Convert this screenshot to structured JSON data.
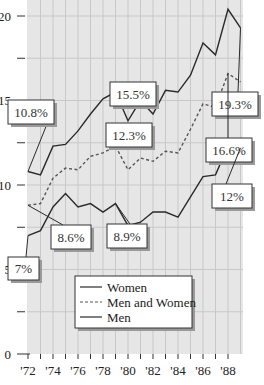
{
  "chart_data": {
    "type": "line",
    "title": "",
    "xlabel": "",
    "ylabel": "",
    "x": [
      1972,
      1973,
      1974,
      1975,
      1976,
      1977,
      1978,
      1979,
      1980,
      1981,
      1982,
      1983,
      1984,
      1985,
      1986,
      1987,
      1988,
      1989
    ],
    "x_tick_labels": [
      "'72",
      "'74",
      "'76",
      "'78",
      "'80",
      "'82",
      "'84",
      "'86",
      "'88"
    ],
    "x_tick_values": [
      1972,
      1974,
      1976,
      1978,
      1980,
      1982,
      1984,
      1986,
      1988
    ],
    "y_tick_labels": [
      "0",
      "5",
      "10",
      "15",
      "20"
    ],
    "y_tick_values": [
      0,
      5,
      10,
      15,
      20
    ],
    "ylim": [
      0,
      21
    ],
    "xlim": [
      1972,
      1989.2
    ],
    "grid": true,
    "legend_position": "lower center",
    "series": [
      {
        "name": "Women",
        "style": "solid",
        "values": [
          10.8,
          10.6,
          12.3,
          12.4,
          13.2,
          14.2,
          15.1,
          15.5,
          13.8,
          15.0,
          14.2,
          15.6,
          15.5,
          16.5,
          18.4,
          17.7,
          20.4,
          19.3
        ]
      },
      {
        "name": "Men and Women",
        "style": "dashed",
        "values": [
          8.8,
          8.9,
          10.4,
          11.0,
          10.9,
          11.7,
          11.9,
          12.3,
          10.9,
          11.6,
          11.4,
          12.0,
          11.9,
          13.3,
          14.8,
          14.6,
          16.6,
          16.1
        ]
      },
      {
        "name": "Men",
        "style": "solid",
        "values": [
          7.0,
          7.3,
          8.7,
          9.5,
          8.7,
          8.9,
          8.4,
          8.9,
          7.6,
          7.8,
          8.4,
          8.4,
          8.1,
          9.3,
          10.5,
          10.6,
          12.3,
          12.2
        ]
      }
    ],
    "annotations": [
      {
        "text": "19.3%",
        "series": "Women",
        "x": 1989,
        "y": 19.3
      },
      {
        "text": "15.5%",
        "series": "Women",
        "x": 1979,
        "y": 15.5
      },
      {
        "text": "10.8%",
        "series": "Women",
        "x": 1972,
        "y": 10.8
      },
      {
        "text": "16.6%",
        "series": "Men and Women",
        "x": 1988,
        "y": 16.6
      },
      {
        "text": "12.3%",
        "series": "Men and Women",
        "x": 1979,
        "y": 12.3
      },
      {
        "text": "8.6%",
        "series": "Men and Women",
        "x": 1972,
        "y": 8.8
      },
      {
        "text": "12%",
        "series": "Men",
        "x": 1989,
        "y": 12.2
      },
      {
        "text": "8.9%",
        "series": "Men",
        "x": 1979,
        "y": 8.9
      },
      {
        "text": "7%",
        "series": "Men",
        "x": 1972,
        "y": 7.0
      }
    ]
  },
  "colors": {
    "plot_background": "#e6e6e6",
    "grid": "#c8c8c8",
    "line": "#2a2a2a",
    "dashed_line": "#555555",
    "callout_fill": "#ffffff",
    "callout_shadow": "#9a9a9a"
  },
  "legend": {
    "items": [
      {
        "label": "Women",
        "style": "solid"
      },
      {
        "label": "Men and Women",
        "style": "dashed"
      },
      {
        "label": "Men",
        "style": "solid"
      }
    ]
  }
}
